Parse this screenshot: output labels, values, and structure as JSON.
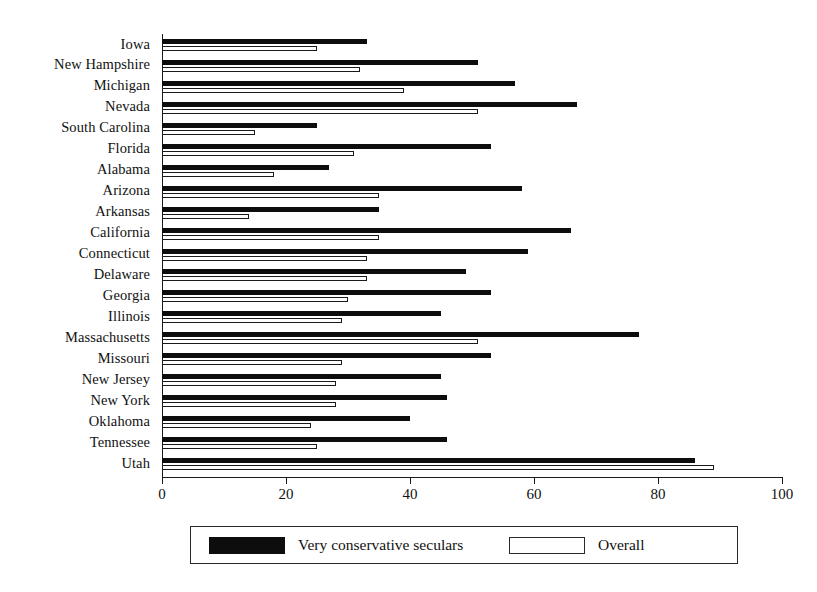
{
  "chart_data": {
    "type": "bar",
    "orientation": "horizontal",
    "title": "",
    "xlabel": "",
    "ylabel": "",
    "xlim": [
      0,
      100
    ],
    "xticks": [
      0,
      20,
      40,
      60,
      80,
      100
    ],
    "grid": false,
    "legend_position": "bottom",
    "categories": [
      "Iowa",
      "New Hampshire",
      "Michigan",
      "Nevada",
      "South Carolina",
      "Florida",
      "Alabama",
      "Arizona",
      "Arkansas",
      "California",
      "Connecticut",
      "Delaware",
      "Georgia",
      "Illinois",
      "Massachusetts",
      "Missouri",
      "New Jersey",
      "New York",
      "Oklahoma",
      "Tennessee",
      "Utah"
    ],
    "series": [
      {
        "name": "Very conservative seculars",
        "color": "#0d0d0d",
        "values": [
          33,
          51,
          57,
          67,
          25,
          53,
          27,
          58,
          35,
          66,
          59,
          49,
          53,
          45,
          77,
          53,
          45,
          46,
          40,
          46,
          86
        ]
      },
      {
        "name": "Overall",
        "color": "#ffffff",
        "values": [
          25,
          32,
          39,
          51,
          15,
          31,
          18,
          35,
          14,
          35,
          33,
          33,
          30,
          29,
          51,
          29,
          28,
          28,
          24,
          25,
          89
        ]
      }
    ]
  },
  "axis": {
    "tick_labels": [
      "0",
      "20",
      "40",
      "60",
      "80",
      "100"
    ]
  },
  "legend": {
    "entries": [
      {
        "label": "Very conservative seculars",
        "swatch": "dark-swatch-icon"
      },
      {
        "label": "Overall",
        "swatch": "light-swatch-icon"
      }
    ]
  }
}
